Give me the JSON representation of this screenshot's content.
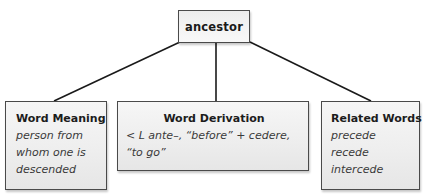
{
  "diagram": {
    "root": {
      "label": "ancestor"
    },
    "branches": [
      {
        "heading": "Word Meaning",
        "lines": [
          "person from",
          "whom one is",
          "descended"
        ]
      },
      {
        "heading": "Word Derivation",
        "lines": [
          "< L ante–, “before” + cedere,",
          "“to go”"
        ]
      },
      {
        "heading": "Related Words",
        "lines": [
          "precede",
          "recede",
          "intercede"
        ]
      }
    ],
    "colors": {
      "border": "#4a4a4a",
      "box_fill_top": "#f6f6f6",
      "box_fill_bottom": "#e6e6e6",
      "connector": "#1a1a1a",
      "text": "#222222"
    }
  }
}
